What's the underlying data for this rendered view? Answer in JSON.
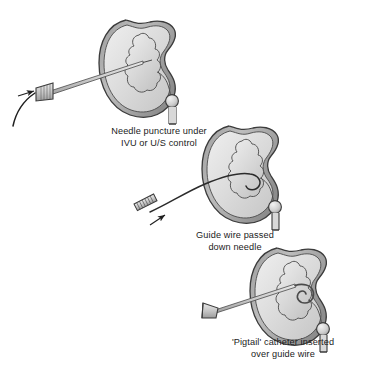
{
  "figure": {
    "width": 375,
    "height": 381,
    "background_color": "#ffffff"
  },
  "palette": {
    "outline": "#3b3b3b",
    "capsule_dark": "#6f6f6f",
    "cortex_fill": "#d9d9d9",
    "cortex_highlight": "#ececec",
    "pelvis_fill": "#cfcfcf",
    "pelvis_highlight": "#e6e6e6",
    "instrument_fill": "#c9c9c9",
    "instrument_outline": "#4a4a4a",
    "wire_color": "#2b2b2b",
    "text_color": "#1b1b1b"
  },
  "panels": [
    {
      "id": "panel-1",
      "step_number": 1,
      "caption_line_1": "Needle puncture under",
      "caption_line_2": "IVU or U/S control",
      "instrument": "puncture-needle",
      "instrument_label": "Needle with flared hub",
      "anatomy": "right kidney with renal pelvis, calyces, ureter and calculus",
      "markers": [
        "direction-arrow",
        "skin-surface-line"
      ]
    },
    {
      "id": "panel-2",
      "step_number": 2,
      "caption_line_1": "Guide wire passed",
      "caption_line_2": "down needle",
      "instrument": "guide-wire-through-needle",
      "instrument_label": "Hatched needle hub with guide wire",
      "anatomy": "right kidney with renal pelvis, calyces, ureter and calculus",
      "markers": [
        "direction-arrow"
      ]
    },
    {
      "id": "panel-3",
      "step_number": 3,
      "caption_line_1": "'Pigtail' catheter inserted",
      "caption_line_2": "over guide wire",
      "instrument": "pigtail-catheter",
      "instrument_label": "Pigtail catheter with coiled tip and funnel hub",
      "anatomy": "right kidney with renal pelvis, calyces, ureter and calculus",
      "markers": [
        "pigtail-coil"
      ]
    }
  ]
}
